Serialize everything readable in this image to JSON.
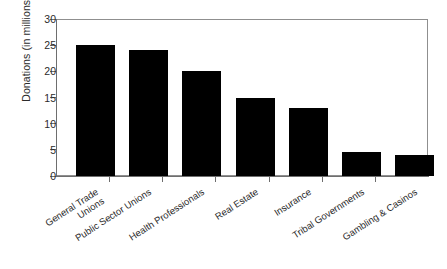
{
  "chart_data": {
    "type": "bar",
    "title": "",
    "xlabel": "",
    "ylabel": "Donations (in millions)",
    "categories": [
      "General Trade Unions",
      "Public Sector Unions",
      "Health Professionals",
      "Real Estate",
      "Insurance",
      "Tribal Governments",
      "Gambling & Casinos"
    ],
    "category_lines": [
      [
        "General Trade",
        "Unions"
      ],
      [
        "Public Sector Unions"
      ],
      [
        "Health Professionals"
      ],
      [
        "Real Estate"
      ],
      [
        "Insurance"
      ],
      [
        "Tribal Governments"
      ],
      [
        "Gambling & Casinos"
      ]
    ],
    "values": [
      25,
      24,
      20,
      15,
      13,
      4.5,
      4.1
    ],
    "ylim": [
      0,
      30
    ],
    "yticks": [
      0,
      5,
      10,
      15,
      20,
      25,
      30
    ],
    "ytick_labels": [
      "0",
      "5",
      "10",
      "15",
      "20",
      "25",
      "30"
    ],
    "grid": false,
    "legend": false,
    "bar_color": "#000000",
    "background_color": "#ffffff",
    "axis_color": "#6e6e6e",
    "text_color": "#2b2b2b"
  }
}
